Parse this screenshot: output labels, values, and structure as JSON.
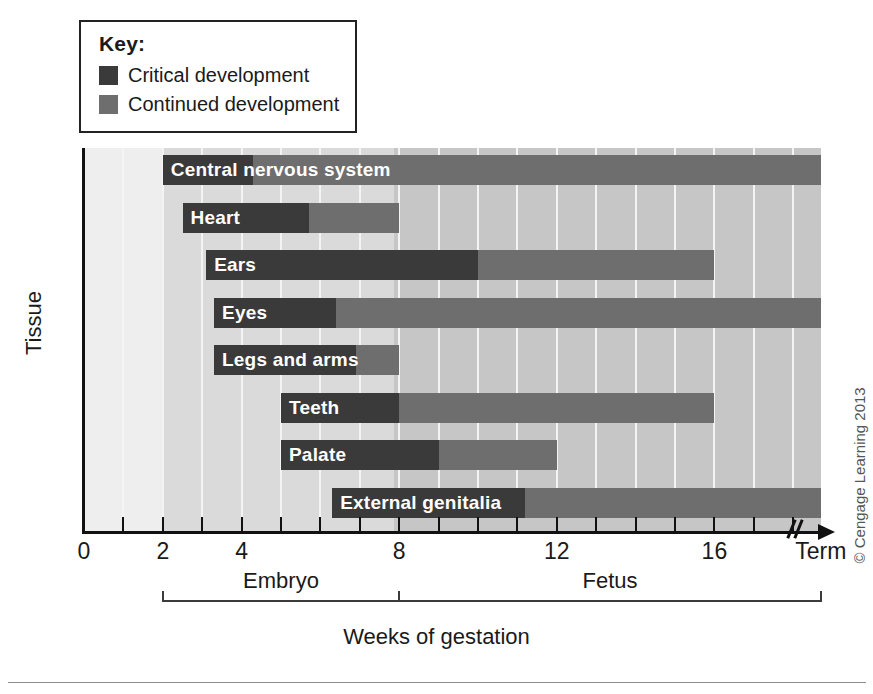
{
  "legend": {
    "title": "Key:",
    "items": [
      {
        "label": "Critical development",
        "color": "#3a3a3a"
      },
      {
        "label": "Continued development",
        "color": "#6e6e6e"
      }
    ]
  },
  "axes": {
    "y_title": "Tissue",
    "x_caption": "Weeks of gestation",
    "x_tick_labels": [
      "0",
      "2",
      "4",
      "8",
      "12",
      "16",
      "Term"
    ],
    "x_tick_weeks": [
      0,
      2,
      4,
      8,
      12,
      16,
      18.7
    ],
    "x_minor_weeks": [
      1,
      3,
      5,
      6,
      7,
      9,
      10,
      11,
      13,
      14,
      15,
      16,
      17
    ],
    "periods": [
      {
        "label": "Embryo",
        "start_week": 2,
        "end_week": 8
      },
      {
        "label": "Fetus",
        "start_week": 8,
        "end_week": 18.7
      }
    ]
  },
  "credit": "© Cengage Learning 2013",
  "chart_data": {
    "type": "bar",
    "xlabel": "Weeks of gestation",
    "ylabel": "Tissue",
    "xlim": [
      0,
      18.7
    ],
    "grid": true,
    "orientation": "horizontal-gantt",
    "legend_position": "top-left",
    "series": [
      {
        "name": "Critical development",
        "color": "#3a3a3a"
      },
      {
        "name": "Continued development",
        "color": "#6e6e6e"
      }
    ],
    "categories": [
      "Central nervous system",
      "Heart",
      "Ears",
      "Eyes",
      "Legs and arms",
      "Teeth",
      "Palate",
      "External genitalia"
    ],
    "bars": [
      {
        "tissue": "Central nervous system",
        "start_week": 2.0,
        "critical_end_week": 4.3,
        "continued_end_week": 18.7
      },
      {
        "tissue": "Heart",
        "start_week": 2.5,
        "critical_end_week": 5.7,
        "continued_end_week": 8.0
      },
      {
        "tissue": "Ears",
        "start_week": 3.1,
        "critical_end_week": 10.0,
        "continued_end_week": 16.0
      },
      {
        "tissue": "Eyes",
        "start_week": 3.3,
        "critical_end_week": 6.4,
        "continued_end_week": 18.7
      },
      {
        "tissue": "Legs and arms",
        "start_week": 3.3,
        "critical_end_week": 6.9,
        "continued_end_week": 8.0
      },
      {
        "tissue": "Teeth",
        "start_week": 5.0,
        "critical_end_week": 8.0,
        "continued_end_week": 16.0
      },
      {
        "tissue": "Palate",
        "start_week": 5.0,
        "critical_end_week": 9.0,
        "continued_end_week": 12.0
      },
      {
        "tissue": "External genitalia",
        "start_week": 6.3,
        "critical_end_week": 11.2,
        "continued_end_week": 18.7
      }
    ]
  }
}
